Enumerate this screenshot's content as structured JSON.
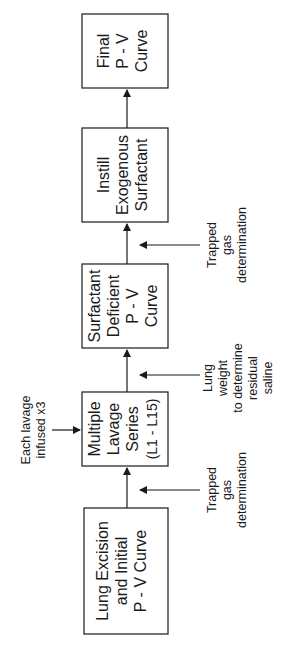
{
  "diagram": {
    "orientation": "rotated-90-ccw",
    "flow_direction": "bottom-to-top",
    "boxes": [
      {
        "id": "lung-excision",
        "lines": [
          "Lung Excision",
          "and Initial",
          "P - V Curve"
        ]
      },
      {
        "id": "multiple-lavage",
        "lines": [
          "Multiple",
          "Lavage",
          "Series",
          "(L1 - L15)"
        ]
      },
      {
        "id": "surfactant-deficient",
        "lines": [
          "Surfactant",
          "Deficient",
          "P - V",
          "Curve"
        ]
      },
      {
        "id": "instill-surfactant",
        "lines": [
          "Instill",
          "Exogenous",
          "Surfactant"
        ]
      },
      {
        "id": "final-pv",
        "lines": [
          "Final",
          "P - V",
          "Curve"
        ]
      }
    ],
    "side_notes": [
      {
        "id": "trapped-gas-1",
        "position": "between lung-excision and multiple-lavage",
        "lines": [
          "Trapped",
          "gas",
          "determination"
        ]
      },
      {
        "id": "lung-weight",
        "position": "between multiple-lavage and surfactant-deficient",
        "lines": [
          "Lung",
          "weight",
          "to determine",
          "residual",
          "saline"
        ]
      },
      {
        "id": "trapped-gas-2",
        "position": "between surfactant-deficient and instill-surfactant",
        "lines": [
          "Trapped",
          "gas",
          "determination"
        ]
      }
    ],
    "top_note": {
      "id": "lavage-infused",
      "target": "multiple-lavage",
      "lines": [
        "Each lavage",
        "infused x3"
      ]
    },
    "colors": {
      "stroke": "#1a1a1a",
      "background": "#ffffff"
    }
  }
}
